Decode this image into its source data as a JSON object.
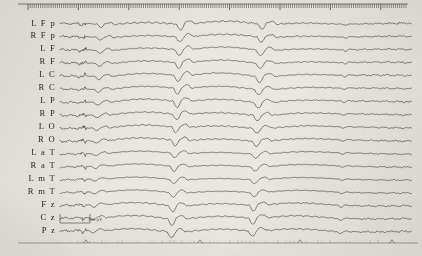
{
  "recording": {
    "type": "eeg-chart-recording",
    "title": "",
    "channel_count": 17,
    "background_color": "#e9e7e2",
    "trace_color": "#1d1b17"
  },
  "channels": [
    {
      "label": "L F p",
      "index": 0
    },
    {
      "label": "R F p",
      "index": 1
    },
    {
      "label": "L F",
      "index": 2
    },
    {
      "label": "R F",
      "index": 3
    },
    {
      "label": "L C",
      "index": 4
    },
    {
      "label": "R C",
      "index": 5
    },
    {
      "label": "L P",
      "index": 6
    },
    {
      "label": "R P",
      "index": 7
    },
    {
      "label": "L O",
      "index": 8
    },
    {
      "label": "R O",
      "index": 9
    },
    {
      "label": "L a T",
      "index": 10
    },
    {
      "label": "R a T",
      "index": 11
    },
    {
      "label": "L m T",
      "index": 12
    },
    {
      "label": "R m T",
      "index": 13
    },
    {
      "label": "F z",
      "index": 14
    },
    {
      "label": "C z",
      "index": 15
    },
    {
      "label": "P z",
      "index": 16
    }
  ],
  "calibration": {
    "amplitude_label": "100 µV",
    "bar_x": 60,
    "bar_y": 214,
    "bar_width": 30,
    "bar_height": 9
  },
  "top_ruler": {
    "x_start": 28,
    "x_end": 408,
    "y": 8,
    "tick_spacing": 2.1,
    "tick_height": 4,
    "major_every": 24,
    "major_height": 6
  },
  "bottom_timeline": {
    "x_start": 18,
    "x_end": 418,
    "y": 243,
    "markers": [
      86,
      200,
      300,
      392
    ],
    "tick_spacing": 4
  },
  "chart_data": {
    "type": "line",
    "title": "",
    "xlabel": "",
    "ylabel": "",
    "grid": false,
    "legend_position": "left",
    "x_range": [
      60,
      412
    ],
    "row_top": 24,
    "row_spacing": 12.95,
    "categories": [
      "L F p",
      "R F p",
      "L F",
      "R F",
      "L C",
      "R C",
      "L P",
      "R P",
      "L O",
      "R O",
      "L a T",
      "R a T",
      "L m T",
      "R m T",
      "F z",
      "C z",
      "P z"
    ],
    "phases": [
      {
        "name": "pre-ictal",
        "x_start": 60,
        "x_end": 86,
        "amplitude": 1.4,
        "frequency": 9.0,
        "pattern": "low-amplitude-background"
      },
      {
        "name": "ictal-onset",
        "x_start": 86,
        "x_end": 118,
        "amplitude": 4.0,
        "frequency": 3.4,
        "pattern": "rhythmic-buildup"
      },
      {
        "name": "ictal-peak",
        "x_start": 118,
        "x_end": 300,
        "amplitude": 5.6,
        "frequency": 3.1,
        "pattern": "generalized-spike-wave"
      },
      {
        "name": "ictal-offset",
        "x_start": 300,
        "x_end": 352,
        "amplitude": 4.4,
        "frequency": 2.7,
        "pattern": "slowing-spike-wave"
      },
      {
        "name": "post-ictal",
        "x_start": 352,
        "x_end": 412,
        "amplitude": 1.2,
        "frequency": 6.5,
        "pattern": "suppression"
      }
    ],
    "series": [
      {
        "name": "L F p",
        "amp_scale": 1.0,
        "phase": 0.0,
        "base_freq": 9.5,
        "noise": 0.95
      },
      {
        "name": "R F p",
        "amp_scale": 0.92,
        "phase": 0.35,
        "base_freq": 9.0,
        "noise": 0.8
      },
      {
        "name": "L F",
        "amp_scale": 1.08,
        "phase": 0.7,
        "base_freq": 8.6,
        "noise": 0.7
      },
      {
        "name": "R F",
        "amp_scale": 1.02,
        "phase": 1.05,
        "base_freq": 9.2,
        "noise": 0.72
      },
      {
        "name": "L C",
        "amp_scale": 1.14,
        "phase": 1.4,
        "base_freq": 8.2,
        "noise": 0.68
      },
      {
        "name": "R C",
        "amp_scale": 1.06,
        "phase": 1.75,
        "base_freq": 8.9,
        "noise": 0.74
      },
      {
        "name": "L P",
        "amp_scale": 1.1,
        "phase": 2.1,
        "base_freq": 8.4,
        "noise": 0.78
      },
      {
        "name": "R P",
        "amp_scale": 1.0,
        "phase": 2.45,
        "base_freq": 9.1,
        "noise": 0.76
      },
      {
        "name": "L O",
        "amp_scale": 0.94,
        "phase": 2.8,
        "base_freq": 9.7,
        "noise": 0.82
      },
      {
        "name": "R O",
        "amp_scale": 0.98,
        "phase": 3.15,
        "base_freq": 9.3,
        "noise": 0.86
      },
      {
        "name": "L a T",
        "amp_scale": 0.8,
        "phase": 3.5,
        "base_freq": 7.8,
        "noise": 0.52
      },
      {
        "name": "R a T",
        "amp_scale": 0.84,
        "phase": 3.85,
        "base_freq": 8.1,
        "noise": 0.55
      },
      {
        "name": "L m T",
        "amp_scale": 0.76,
        "phase": 4.2,
        "base_freq": 7.5,
        "noise": 0.48
      },
      {
        "name": "R m T",
        "amp_scale": 0.82,
        "phase": 4.55,
        "base_freq": 7.9,
        "noise": 0.5
      },
      {
        "name": "F z",
        "amp_scale": 1.04,
        "phase": 4.9,
        "base_freq": 8.8,
        "noise": 0.8
      },
      {
        "name": "C z",
        "amp_scale": 1.12,
        "phase": 5.25,
        "base_freq": 8.5,
        "noise": 0.84
      },
      {
        "name": "P z",
        "amp_scale": 1.06,
        "phase": 5.6,
        "base_freq": 8.7,
        "noise": 0.88
      }
    ]
  }
}
